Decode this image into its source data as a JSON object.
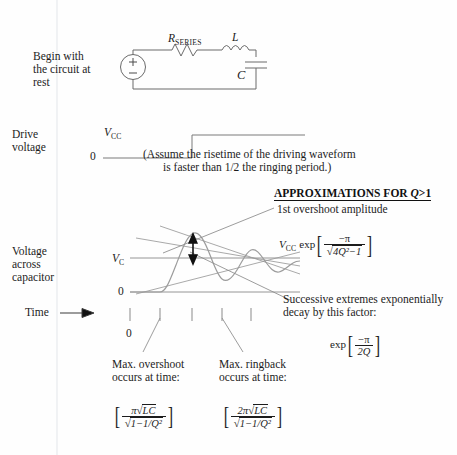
{
  "diagram": {
    "title_note": "RLC ringing step response approximations",
    "circuit": {
      "caption_lines": [
        "Begin with",
        "the circuit at",
        "rest"
      ],
      "resistor_label": "R",
      "resistor_sub": "SERIES",
      "inductor_label": "L",
      "capacitor_label": "C",
      "source_plus": "+",
      "source_minus": "-"
    },
    "drive": {
      "label_lines": [
        "Drive",
        "voltage"
      ],
      "high_label": "V",
      "high_sub": "CC",
      "zero_label": "0",
      "note_line1": "(Assume the risetime of the driving waveform",
      "note_line2": "is faster than 1/2 the ringing period.)"
    },
    "response": {
      "label_lines": [
        "Voltage",
        "across",
        "capacitor"
      ],
      "vc_label": "V",
      "vc_sub": "C",
      "zero_label": "0",
      "time_label": "Time",
      "time_arrow": "→",
      "axis_zero": "0"
    },
    "approx": {
      "heading": "APPROXIMATIONS FOR Q>1",
      "heading_plain": "APPROXIMATIONS FOR ",
      "heading_italic": "Q",
      "heading_tail": ">1",
      "overshoot_caption": "1st overshoot amplitude",
      "overshoot_formula": {
        "prefix_v": "V",
        "prefix_sub": "CC",
        "exp": "exp",
        "numerator": "−π",
        "denominator_radicand": "4Q²−1"
      },
      "decay_caption_line1": "Successive extremes exponentially",
      "decay_caption_line2": "decay by this factor:",
      "decay_formula": {
        "exp": "exp",
        "numerator": "−π",
        "denominator": "2Q"
      }
    },
    "timing": {
      "overshoot": {
        "caption_line1": "Max. overshoot",
        "caption_line2": "occurs at time:",
        "numerator": "π√LC",
        "numerator_pi": "π",
        "numerator_radicand": "LC",
        "denominator_radicand": "1−1/Q²"
      },
      "ringback": {
        "caption_line1": "Max. ringback",
        "caption_line2": "occurs at time:",
        "numerator_pi": "2π",
        "numerator_radicand": "LC",
        "denominator_radicand": "1−1/Q²"
      }
    },
    "colors": {
      "ink": "#1c1c1c",
      "line": "#5a5a5a",
      "light_line": "#9a9a9a",
      "background": "#fefefe"
    }
  }
}
